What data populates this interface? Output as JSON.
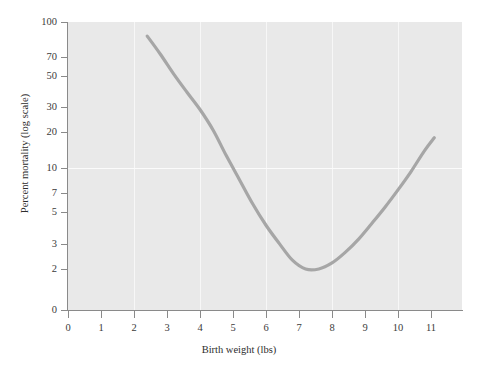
{
  "chart_data": {
    "type": "line",
    "title": "",
    "xlabel": "Birth weight (lbs)",
    "ylabel": "Percent mortality (log scale)",
    "xlim": [
      0,
      11.6
    ],
    "ylim": [
      1.6,
      100
    ],
    "yscale": "log",
    "grid": true,
    "legend": "none",
    "xticks": [
      "0",
      "1",
      "2",
      "3",
      "4",
      "5",
      "6",
      "7",
      "8",
      "9",
      "10",
      "11"
    ],
    "xtick_values": [
      0,
      1,
      2,
      3,
      4,
      5,
      6,
      7,
      8,
      9,
      10,
      11
    ],
    "yticks": [
      "100",
      "70",
      "50",
      "30",
      "20",
      "10",
      "7",
      "5",
      "3",
      "2",
      "0"
    ],
    "ytick_values": [
      100,
      70,
      50,
      30,
      20,
      10,
      7,
      5,
      3,
      2,
      0
    ],
    "series": [
      {
        "name": "mortality",
        "color": "#a6a6a6",
        "x": [
          2.4,
          2.8,
          3.2,
          3.6,
          4.0,
          4.4,
          4.8,
          5.2,
          5.6,
          6.0,
          6.4,
          6.8,
          7.2,
          7.6,
          8.0,
          8.4,
          8.8,
          9.2,
          9.6,
          10.0,
          10.4,
          10.8,
          11.1
        ],
        "values": [
          80.0,
          60.0,
          44.0,
          33.0,
          25.0,
          18.0,
          12.0,
          8.2,
          5.6,
          4.0,
          3.0,
          2.3,
          2.0,
          2.0,
          2.2,
          2.6,
          3.2,
          4.1,
          5.3,
          7.0,
          9.4,
          13.0,
          16.0
        ]
      }
    ],
    "gridlines": {
      "vertical_at_x": [
        2,
        4,
        6,
        8,
        10
      ],
      "horizontal_at_y": [
        10
      ]
    },
    "plot_background": "#e9e9e9",
    "page_background": "#ffffff",
    "axis_color": "#8a8a8a",
    "line_color": "#a6a6a6"
  }
}
